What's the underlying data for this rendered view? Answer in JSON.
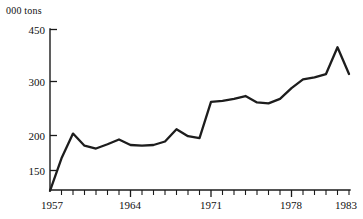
{
  "chart_data": {
    "type": "line",
    "title": "",
    "subtitle": "",
    "xlabel": "",
    "ylabel": "000 tons",
    "y_axis_scale": "log",
    "ylim": [
      128,
      470
    ],
    "xlim": [
      1957,
      1983
    ],
    "grid": false,
    "legend": false,
    "y_ticks": [
      150,
      200,
      300,
      450
    ],
    "y_tick_labels": [
      "150",
      "200",
      "300",
      "450"
    ],
    "x_ticks": [
      1957,
      1964,
      1971,
      1978,
      1983
    ],
    "x_tick_labels": [
      "1957",
      "1964",
      "1971",
      "1978",
      "1983"
    ],
    "x_minor_tick_interval": 1,
    "x": [
      1957,
      1958,
      1959,
      1960,
      1961,
      1962,
      1963,
      1964,
      1965,
      1966,
      1967,
      1968,
      1969,
      1970,
      1971,
      1972,
      1973,
      1974,
      1975,
      1976,
      1977,
      1978,
      1979,
      1980,
      1981,
      1982,
      1983
    ],
    "series": [
      {
        "name": "000 tons",
        "values": [
          128,
          165,
          200,
          182,
          178,
          184,
          191,
          183,
          182,
          183,
          188,
          207,
          196,
          193,
          256,
          258,
          262,
          268,
          255,
          253,
          262,
          285,
          305,
          310,
          318,
          392,
          318
        ]
      }
    ],
    "annotations": [],
    "units": "000 tons"
  },
  "axis": {
    "unit_label": "000 tons"
  },
  "y_axis": {
    "ticks": [
      {
        "label": "450",
        "value": 450
      },
      {
        "label": "300",
        "value": 300
      },
      {
        "label": "200",
        "value": 200
      },
      {
        "label": "150",
        "value": 150
      }
    ]
  },
  "x_axis": {
    "ticks": [
      {
        "label": "1957",
        "value": 1957
      },
      {
        "label": "1964",
        "value": 1964
      },
      {
        "label": "1971",
        "value": 1971
      },
      {
        "label": "1978",
        "value": 1978
      },
      {
        "label": "1983",
        "value": 1983
      }
    ]
  },
  "colors": {
    "line": "#1d1d1d",
    "axis": "#1a1a1a",
    "text": "#111111",
    "background": "#ffffff"
  }
}
